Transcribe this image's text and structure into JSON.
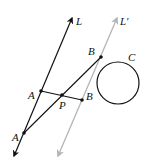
{
  "diagram": {
    "colors": {
      "line_L": "#111111",
      "line_L_prime": "#b4b4b4",
      "circle": "#111111",
      "segments": "#111111",
      "points": "#111111"
    },
    "labels": {
      "line_L": "L",
      "line_L_prime": "L′",
      "circle": "C",
      "point_B_top": "B",
      "point_A_mid": "A",
      "point_P": "P",
      "point_B_mid": "B",
      "point_A_bottom": "A"
    },
    "geometry": {
      "line_L": {
        "x1": 14,
        "y1": 156,
        "x2": 72,
        "y2": 18
      },
      "line_L_prime": {
        "x1": 58,
        "y1": 156,
        "x2": 117,
        "y2": 18
      },
      "circle": {
        "cx": 118,
        "cy": 83,
        "r": 21
      },
      "points": {
        "A_mid": {
          "x": 41,
          "y": 91
        },
        "P": {
          "x": 62,
          "y": 95
        },
        "B_mid": {
          "x": 82,
          "y": 100
        },
        "A_bottom": {
          "x": 24,
          "y": 133
        },
        "B_top": {
          "x": 101,
          "y": 57
        }
      }
    }
  }
}
